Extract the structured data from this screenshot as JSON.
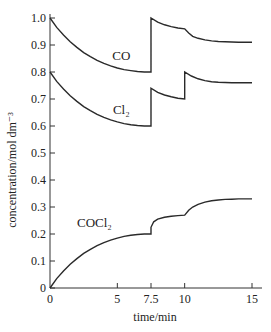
{
  "chart_data": {
    "type": "line",
    "title": "",
    "xlabel": "time/min",
    "ylabel": "concentration/mol dm⁻³",
    "xlim": [
      0,
      15
    ],
    "ylim": [
      0,
      1.0
    ],
    "x_ticks": [
      0,
      5,
      7.5,
      10,
      15
    ],
    "x_tick_labels": [
      "0",
      "5",
      "7.5",
      "10",
      "15"
    ],
    "y_ticks": [
      0,
      0.1,
      0.2,
      0.3,
      0.4,
      0.5,
      0.6,
      0.7,
      0.8,
      0.9,
      1.0
    ],
    "y_tick_labels": [
      "0",
      "0.1",
      "0.2",
      "0.3",
      "0.4",
      "0.5",
      "0.6",
      "0.7",
      "0.8",
      "0.9",
      "1.0"
    ],
    "grid": false,
    "legend": "inline labels",
    "series": [
      {
        "name": "CO",
        "label": "CO",
        "label_pos": [
          5.3,
          0.845
        ],
        "x": [
          0,
          0.5,
          1,
          1.5,
          2,
          2.5,
          3,
          3.5,
          4,
          4.5,
          5,
          5.5,
          6,
          6.5,
          7,
          7.5,
          7.5,
          8,
          8.5,
          9,
          9.5,
          10,
          10.3,
          10.6,
          11,
          11.5,
          12,
          12.5,
          13,
          13.5,
          14,
          14.5,
          15
        ],
        "values": [
          1.0,
          0.965,
          0.937,
          0.912,
          0.891,
          0.872,
          0.857,
          0.843,
          0.832,
          0.823,
          0.815,
          0.809,
          0.805,
          0.802,
          0.8,
          0.8,
          1.0,
          0.985,
          0.975,
          0.968,
          0.963,
          0.96,
          0.944,
          0.932,
          0.925,
          0.919,
          0.915,
          0.913,
          0.912,
          0.911,
          0.91,
          0.91,
          0.91
        ]
      },
      {
        "name": "Cl2",
        "label": "Cl₂",
        "label_pos": [
          5.3,
          0.645
        ],
        "x": [
          0,
          0.5,
          1,
          1.5,
          2,
          2.5,
          3,
          3.5,
          4,
          4.5,
          5,
          5.5,
          6,
          6.5,
          7,
          7.5,
          7.5,
          8,
          8.5,
          9,
          9.5,
          10,
          10,
          10.5,
          11,
          11.5,
          12,
          12.5,
          13,
          13.5,
          14,
          14.5,
          15
        ],
        "values": [
          0.8,
          0.765,
          0.737,
          0.712,
          0.691,
          0.672,
          0.657,
          0.643,
          0.632,
          0.623,
          0.615,
          0.609,
          0.605,
          0.602,
          0.6,
          0.6,
          0.74,
          0.725,
          0.715,
          0.708,
          0.703,
          0.7,
          0.8,
          0.785,
          0.775,
          0.768,
          0.764,
          0.762,
          0.761,
          0.76,
          0.76,
          0.76,
          0.76
        ]
      },
      {
        "name": "COCl2",
        "label": "COCl₂",
        "label_pos": [
          3.3,
          0.225
        ],
        "x": [
          0,
          0.5,
          1,
          1.5,
          2,
          2.5,
          3,
          3.5,
          4,
          4.5,
          5,
          5.5,
          6,
          6.5,
          7,
          7.5,
          7.5,
          7.7,
          8,
          8.5,
          9,
          9.5,
          10,
          10.3,
          10.6,
          11,
          11.5,
          12,
          12.5,
          13,
          13.5,
          14,
          14.5,
          15
        ],
        "values": [
          0,
          0.035,
          0.063,
          0.088,
          0.109,
          0.128,
          0.143,
          0.157,
          0.168,
          0.177,
          0.185,
          0.191,
          0.195,
          0.198,
          0.2,
          0.2,
          0.225,
          0.245,
          0.255,
          0.262,
          0.266,
          0.268,
          0.27,
          0.288,
          0.3,
          0.31,
          0.318,
          0.323,
          0.326,
          0.328,
          0.329,
          0.33,
          0.33,
          0.33
        ]
      }
    ]
  },
  "layout": {
    "x_origin_px": 50,
    "x_end_px": 252,
    "y_origin_px": 288,
    "y_top_px": 18,
    "axis_extend_px": 262
  }
}
